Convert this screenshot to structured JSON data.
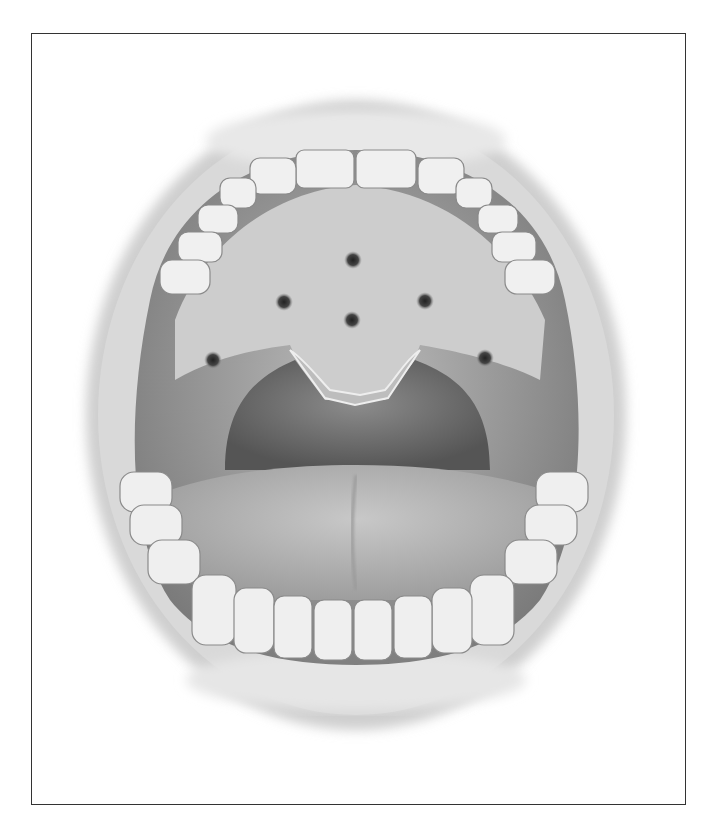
{
  "figure": {
    "style": "grayscale",
    "frame_color": "#333333",
    "background": "#ffffff",
    "markers": [
      {
        "x": 353,
        "y": 260
      },
      {
        "x": 284,
        "y": 302
      },
      {
        "x": 425,
        "y": 301
      },
      {
        "x": 352,
        "y": 320
      },
      {
        "x": 213,
        "y": 360
      },
      {
        "x": 485,
        "y": 358
      }
    ]
  }
}
